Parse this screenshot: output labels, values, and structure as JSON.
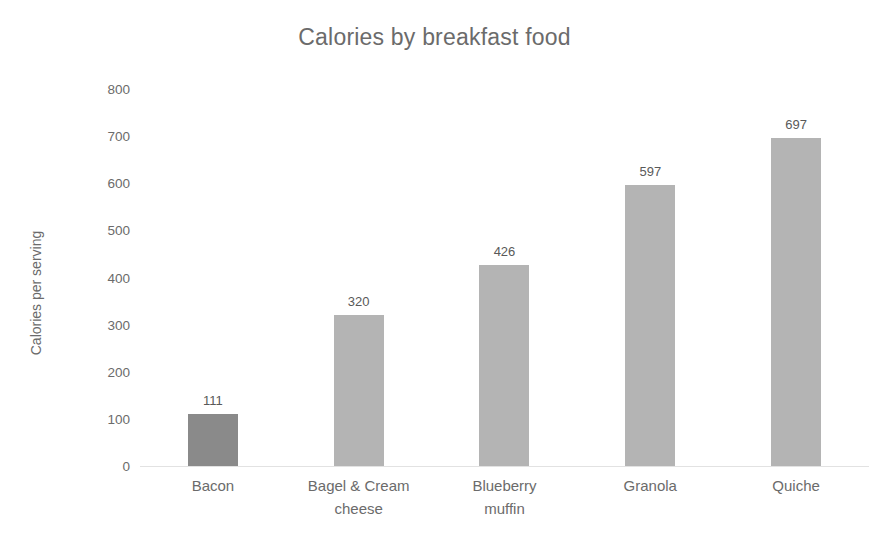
{
  "chart_data": {
    "type": "bar",
    "title": "Calories by breakfast food",
    "xlabel": "",
    "ylabel": "Calories per serving",
    "categories": [
      "Bacon",
      "Bagel & Cream cheese",
      "Blueberry muffin",
      "Granola",
      "Quiche"
    ],
    "category_lines": [
      [
        "Bacon"
      ],
      [
        "Bagel & Cream",
        "cheese"
      ],
      [
        "Blueberry",
        "muffin"
      ],
      [
        "Granola"
      ],
      [
        "Quiche"
      ]
    ],
    "values": [
      111,
      320,
      426,
      597,
      697
    ],
    "value_labels": [
      "111",
      "320",
      "426",
      "597",
      "697"
    ],
    "bar_colors": [
      "#8a8a8a",
      "#b4b4b4",
      "#b4b4b4",
      "#b4b4b4",
      "#b4b4b4"
    ],
    "ylim": [
      0,
      800
    ],
    "yticks": [
      800,
      700,
      600,
      500,
      400,
      300,
      200,
      100,
      0
    ],
    "ytick_labels": [
      "800",
      "700",
      "600",
      "500",
      "400",
      "300",
      "200",
      "100",
      "0"
    ],
    "grid": false,
    "legend": false,
    "legend_position": "none",
    "title_color": "#6b6b6b",
    "axis_text_color": "#6b6b6b",
    "data_label_color": "#595959",
    "background_color": "#ffffff"
  }
}
